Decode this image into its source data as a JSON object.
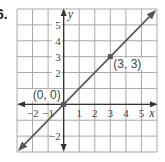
{
  "problem_number": "6.",
  "chart_data": {
    "type": "line",
    "title": "",
    "xlabel": "x",
    "ylabel": "y",
    "xlim": [
      -3,
      6
    ],
    "ylim": [
      -3,
      6
    ],
    "grid": true,
    "x_ticks": [
      -2,
      -1,
      1,
      2,
      3,
      4,
      5
    ],
    "x_tick_labels": [
      "−2",
      "−1",
      "1",
      "2",
      "3",
      "4",
      "5"
    ],
    "y_ticks": [
      -2,
      2,
      3,
      4,
      5
    ],
    "y_tick_labels": [
      "−2",
      "2",
      "3",
      "4",
      "5"
    ],
    "series": [
      {
        "name": "y = x",
        "equation": "y = x",
        "slope": 1,
        "intercept": 0,
        "x": [
          -3,
          6
        ],
        "y": [
          -3,
          6
        ],
        "arrows": "both",
        "color": "#555555"
      }
    ],
    "points": [
      {
        "x": 0,
        "y": 0,
        "label": "(0, 0)"
      },
      {
        "x": 3,
        "y": 3,
        "label": "(3, 3)"
      }
    ]
  }
}
